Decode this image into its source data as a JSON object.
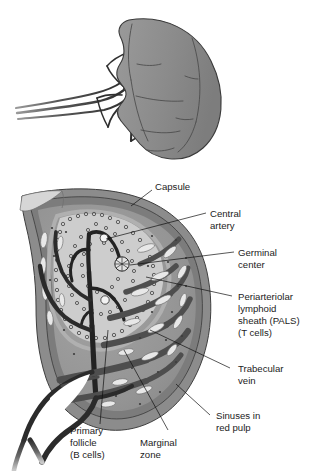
{
  "figure": {
    "panels": [
      {
        "id": "whole-spleen",
        "name": "whole-spleen-view"
      },
      {
        "id": "spleen-cross-section",
        "name": "spleen-cross-section-view"
      }
    ]
  },
  "labels": [
    {
      "key": "capsule",
      "text": "Capsule",
      "lines": [
        "Capsule"
      ]
    },
    {
      "key": "central_artery",
      "text": "Central artery",
      "lines": [
        "Central",
        "artery"
      ]
    },
    {
      "key": "germinal_center",
      "text": "Germinal center",
      "lines": [
        "Germinal",
        "center"
      ]
    },
    {
      "key": "pals",
      "text": "Periarteriolar lymphoid sheath (PALS) (T cells)",
      "lines": [
        "Periarteriolar",
        "lymphoid",
        "sheath (PALS)",
        "(T cells)"
      ]
    },
    {
      "key": "trabecular_vein",
      "text": "Trabecular vein",
      "lines": [
        "Trabecular",
        "vein"
      ]
    },
    {
      "key": "sinuses",
      "text": "Sinuses in red pulp",
      "lines": [
        "Sinuses in",
        "red pulp"
      ]
    },
    {
      "key": "primary_follicle",
      "text": "Primary follicle (B cells)",
      "lines": [
        "Primary",
        "follicle",
        "(B cells)"
      ]
    },
    {
      "key": "marginal_zone",
      "text": "Marginal zone",
      "lines": [
        "Marginal",
        "zone"
      ]
    }
  ],
  "colors": {
    "background": "#ffffff",
    "capsule_outer": "#8c8c8c",
    "capsule_inner": "#6e6e6e",
    "red_pulp": "#9a9a9a",
    "white_pulp": "#cfcfcf",
    "marginal_zone": "#b4b4b4",
    "vessel_dark": "#2b2b2b",
    "trabecula": "#5a5a5a",
    "sinus_lumen": "#ececec",
    "organ_fill": "#8e8e8e",
    "organ_outline": "#3a3a3a",
    "label_text": "#1c1c1c",
    "leader_line": "#101010"
  }
}
